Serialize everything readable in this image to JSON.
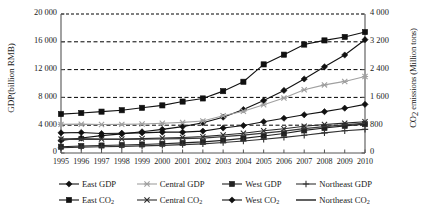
{
  "chart_data": {
    "type": "line",
    "title": "",
    "xlabel": "",
    "ylabel": "GDP(billion RMB)",
    "ylabel_right": "CO2 emissions (Million tons)",
    "grid": true,
    "legend_position": "bottom",
    "categories": [
      "1995",
      "1996",
      "1997",
      "1998",
      "1999",
      "2000",
      "2001",
      "2002",
      "2003",
      "2004",
      "2005",
      "2006",
      "2007",
      "2008",
      "2009",
      "2010"
    ],
    "ylim": [
      0,
      20000
    ],
    "yticks": [
      "0",
      "4 000",
      "8 000",
      "12 000",
      "16 000",
      "20 000"
    ],
    "ylim_right": [
      0,
      4000
    ],
    "yticks_right": [
      "0",
      "800",
      "1 600",
      "2 400",
      "3 200",
      "4 000"
    ],
    "series": [
      {
        "name": "East GDP",
        "axis": "left",
        "marker": "diamond",
        "color": "#111111",
        "values": [
          1800,
          2150,
          2500,
          2750,
          3050,
          3400,
          3800,
          4350,
          5150,
          6250,
          7550,
          9000,
          10650,
          12400,
          14100,
          16300
        ]
      },
      {
        "name": "Central GDP",
        "axis": "left",
        "marker": "star",
        "color": "#a0a0a0",
        "values": [
          4120,
          4150,
          4100,
          4120,
          4180,
          4280,
          4400,
          4600,
          5350,
          6000,
          6950,
          7900,
          9100,
          9800,
          10300,
          11000
        ]
      },
      {
        "name": "West GDP",
        "axis": "left",
        "marker": "square",
        "color": "#222222",
        "values": [
          900,
          1000,
          1080,
          1150,
          1230,
          1330,
          1450,
          1600,
          1820,
          2100,
          2450,
          2800,
          3250,
          3600,
          3900,
          4150
        ]
      },
      {
        "name": "Northeast GDP",
        "axis": "left",
        "marker": "plus",
        "color": "#333333",
        "values": [
          760,
          850,
          900,
          950,
          1020,
          1100,
          1200,
          1320,
          1500,
          1720,
          1980,
          2250,
          2550,
          2900,
          3200,
          3400
        ]
      },
      {
        "name": "East CO2",
        "axis": "right",
        "marker": "square",
        "color": "#111111",
        "values": [
          1120,
          1150,
          1190,
          1230,
          1300,
          1370,
          1480,
          1570,
          1780,
          2050,
          2550,
          2830,
          3120,
          3240,
          3340,
          3480
        ]
      },
      {
        "name": "Central CO2",
        "axis": "right",
        "marker": "x",
        "color": "#2a2a2a",
        "values": [
          400,
          410,
          400,
          405,
          415,
          430,
          445,
          470,
          520,
          570,
          640,
          700,
          770,
          820,
          860,
          900
        ]
      },
      {
        "name": "West CO2",
        "axis": "right",
        "marker": "diamond",
        "color": "#111111",
        "values": [
          580,
          590,
          560,
          570,
          580,
          600,
          600,
          630,
          720,
          790,
          900,
          1000,
          1100,
          1190,
          1290,
          1400
        ]
      },
      {
        "name": "Northeast CO2",
        "axis": "right",
        "marker": "line",
        "color": "#3a3a3a",
        "values": [
          395,
          400,
          390,
          392,
          398,
          405,
          412,
          430,
          470,
          515,
          570,
          630,
          700,
          760,
          810,
          860
        ]
      }
    ]
  },
  "axes": {
    "left_title": "GDP(billion RMB)",
    "right_title_main": "CO",
    "right_title_sub": "2",
    "right_title_rest": " emissions (Million tons)"
  },
  "legend": {
    "rows": [
      [
        {
          "label_main": "East GDP",
          "label_sub": "",
          "marker": "diamond",
          "color": "#111111",
          "name": "east-gdp"
        },
        {
          "label_main": "Central GDP",
          "label_sub": "",
          "marker": "star",
          "color": "#a0a0a0",
          "name": "central-gdp"
        },
        {
          "label_main": "West GDP",
          "label_sub": "",
          "marker": "square",
          "color": "#222222",
          "name": "west-gdp"
        },
        {
          "label_main": "Northeast GDP",
          "label_sub": "",
          "marker": "plus",
          "color": "#333333",
          "name": "northeast-gdp"
        }
      ],
      [
        {
          "label_main": "East CO",
          "label_sub": "2",
          "marker": "square",
          "color": "#111111",
          "name": "east-co2"
        },
        {
          "label_main": "Central CO",
          "label_sub": "2",
          "marker": "x",
          "color": "#2a2a2a",
          "name": "central-co2"
        },
        {
          "label_main": "West CO",
          "label_sub": "2",
          "marker": "diamond",
          "color": "#111111",
          "name": "west-co2"
        },
        {
          "label_main": "Northeast CO",
          "label_sub": "2",
          "marker": "line",
          "color": "#3a3a3a",
          "name": "northeast-co2"
        }
      ]
    ]
  }
}
